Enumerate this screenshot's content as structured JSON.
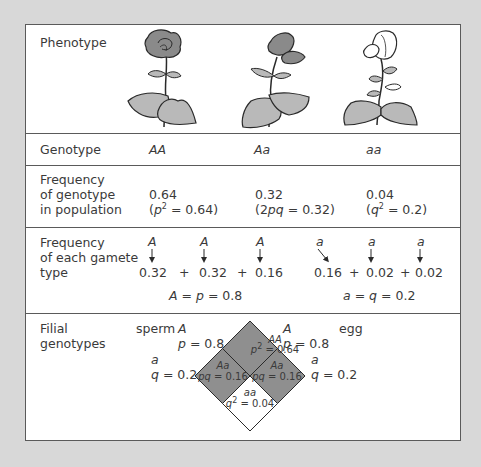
{
  "colors": {
    "background": "#d8d8d8",
    "panel": "#ffffff",
    "border": "#5a5a5a",
    "dominant_cell": "#8f8f8f",
    "recessive_cell": "#ffffff",
    "flower_dark": "#8a8a8a",
    "leaf": "#b9b9b9"
  },
  "rows": {
    "phenotype": {
      "label": "Phenotype",
      "flowers": [
        {
          "genotype": "AA",
          "color": "dark"
        },
        {
          "genotype": "Aa",
          "color": "dark"
        },
        {
          "genotype": "aa",
          "color": "white"
        }
      ]
    },
    "genotype": {
      "label": "Genotype",
      "values": [
        "AA",
        "Aa",
        "aa"
      ]
    },
    "genotype_frequency": {
      "label": "Frequency\nof genotype\nin population",
      "values": [
        {
          "value": "0.64",
          "expr_pre": "(",
          "expr_var": "p",
          "expr_sup": "2",
          "expr_post": " = 0.64)"
        },
        {
          "value": "0.32",
          "expr_pre": "(2",
          "expr_var": "pq",
          "expr_sup": "",
          "expr_post": " = 0.32)"
        },
        {
          "value": "0.04",
          "expr_pre": "(",
          "expr_var": "q",
          "expr_sup": "2",
          "expr_post": " = 0.2)"
        }
      ]
    },
    "gamete_frequency": {
      "label": "Frequency\nof each gamete\ntype",
      "dominant": {
        "alleles": [
          "A",
          "A",
          "A"
        ],
        "values": [
          "0.32",
          "0.32",
          "0.16"
        ],
        "operators": [
          "+",
          "+"
        ],
        "sum_var": "A",
        "sum_mid": "p",
        "sum_value": "= 0.8"
      },
      "recessive": {
        "alleles": [
          "a",
          "a",
          "a"
        ],
        "values": [
          "0.16",
          "0.02",
          "0.02"
        ],
        "operators": [
          "+",
          "+"
        ],
        "sum_var": "a",
        "sum_mid": "q",
        "sum_value": "= 0.2"
      }
    },
    "filial": {
      "label": "Filial\ngenotypes",
      "sperm_label": "sperm",
      "egg_label": "egg",
      "sperm_A": {
        "allele": "A",
        "var": "p",
        "value": "= 0.8"
      },
      "sperm_a": {
        "allele": "a",
        "var": "q",
        "value": "= 0.2"
      },
      "egg_A": {
        "allele": "A",
        "var": "p",
        "value": "= 0.8"
      },
      "egg_a": {
        "allele": "a",
        "var": "q",
        "value": "= 0.2"
      },
      "cells": {
        "top": {
          "genotype": "AA",
          "var": "p",
          "sup": "2",
          "value": " = 0.64"
        },
        "left": {
          "genotype": "Aa",
          "var": "pq",
          "sup": "",
          "value": " = 0.16"
        },
        "right": {
          "genotype": "Aa",
          "var": "pq",
          "sup": "",
          "value": " = 0.16"
        },
        "bottom": {
          "genotype": "aa",
          "var": "q",
          "sup": "2",
          "value": " = 0.04"
        }
      }
    }
  }
}
